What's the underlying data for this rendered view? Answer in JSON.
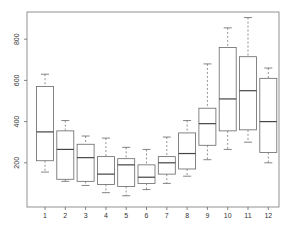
{
  "chart_data": {
    "type": "boxplot",
    "title": "",
    "xlabel": "",
    "ylabel": "",
    "categories": [
      "1",
      "2",
      "3",
      "4",
      "5",
      "6",
      "7",
      "8",
      "9",
      "10",
      "11",
      "12"
    ],
    "y_ticks": [
      200,
      400,
      600,
      800
    ],
    "ylim": [
      0,
      950
    ],
    "grid": false,
    "legend": null,
    "boxes": [
      {
        "label": "1",
        "min": 155,
        "q1": 210,
        "median": 350,
        "q3": 570,
        "max": 630
      },
      {
        "label": "2",
        "min": 110,
        "q1": 120,
        "median": 265,
        "q3": 355,
        "max": 405
      },
      {
        "label": "3",
        "min": 90,
        "q1": 110,
        "median": 225,
        "q3": 290,
        "max": 330
      },
      {
        "label": "4",
        "min": 55,
        "q1": 95,
        "median": 145,
        "q3": 230,
        "max": 320
      },
      {
        "label": "5",
        "min": 40,
        "q1": 85,
        "median": 190,
        "q3": 220,
        "max": 275
      },
      {
        "label": "6",
        "min": 70,
        "q1": 100,
        "median": 130,
        "q3": 190,
        "max": 265
      },
      {
        "label": "7",
        "min": 100,
        "q1": 145,
        "median": 200,
        "q3": 230,
        "max": 325
      },
      {
        "label": "8",
        "min": 135,
        "q1": 170,
        "median": 245,
        "q3": 345,
        "max": 405
      },
      {
        "label": "9",
        "min": 215,
        "q1": 285,
        "median": 390,
        "q3": 465,
        "max": 680
      },
      {
        "label": "10",
        "min": 265,
        "q1": 355,
        "median": 510,
        "q3": 760,
        "max": 855
      },
      {
        "label": "11",
        "min": 300,
        "q1": 360,
        "median": 550,
        "q3": 715,
        "max": 905
      },
      {
        "label": "12",
        "min": 200,
        "q1": 250,
        "median": 400,
        "q3": 610,
        "max": 660
      }
    ],
    "colors": {
      "axis": "#666666",
      "box": "#666666",
      "background": "#ffffff"
    }
  }
}
